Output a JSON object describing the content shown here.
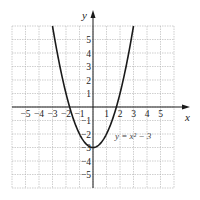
{
  "chart_data": {
    "type": "line",
    "title": "",
    "xlabel": "x",
    "ylabel": "y",
    "xlim": [
      -6,
      6
    ],
    "ylim": [
      -6,
      6
    ],
    "grid": true,
    "x_ticks": [
      "-5",
      "-4",
      "-3",
      "-2",
      "-1",
      "1",
      "2",
      "3",
      "4",
      "5"
    ],
    "y_ticks": [
      "5",
      "4",
      "3",
      "2",
      "1",
      "-1",
      "-2",
      "-3",
      "-4",
      "-5"
    ],
    "annotation": "y = x² − 3",
    "series": [
      {
        "name": "y = x^2 - 3",
        "x": [
          -3,
          -2.5,
          -2,
          -1.5,
          -1,
          -0.5,
          0,
          0.5,
          1,
          1.5,
          2,
          2.5,
          3
        ],
        "y": [
          6,
          3.25,
          1,
          -0.75,
          -2,
          -2.75,
          -3,
          -2.75,
          -2,
          -0.75,
          1,
          3.25,
          6
        ]
      }
    ],
    "colors": {
      "curve": "#1a1a1a",
      "grid": "#b0b0b0",
      "axis": "#1a1a1a"
    }
  },
  "labels": {
    "x_axis": "x",
    "y_axis": "y",
    "equation": "y = x² − 3"
  }
}
